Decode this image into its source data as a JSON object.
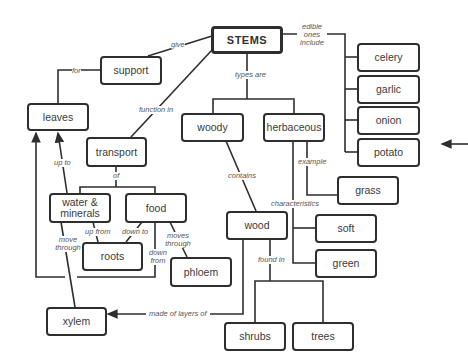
{
  "diagram": {
    "type": "concept-map",
    "root": "STEMS",
    "nodes": {
      "stems": "STEMS",
      "support": "support",
      "leaves": "leaves",
      "transport": "transport",
      "woody": "woody",
      "herbaceous": "herbaceous",
      "celery": "celery",
      "garlic": "garlic",
      "onion": "onion",
      "potato": "potato",
      "grass": "grass",
      "water_minerals": "water & minerals",
      "food": "food",
      "roots": "roots",
      "phloem": "phloem",
      "wood": "wood",
      "soft": "soft",
      "green": "green",
      "xylem": "xylem",
      "shrubs": "shrubs",
      "trees": "trees"
    },
    "links": {
      "give": "give",
      "for": "for",
      "function_in": "function in",
      "types_are": "types are",
      "edible_ones_include": "edible ones include",
      "of": "of",
      "up_to": "up to",
      "contains": "contains",
      "example": "example",
      "characteristics": "characteristics",
      "up_from": "up from",
      "down_to": "down to",
      "moves_through": "moves through",
      "down_from": "down from",
      "move_through": "move through",
      "found_in": "found in",
      "made_of_layers_of": "made of layers of"
    },
    "relations": [
      [
        "STEMS",
        "give",
        "support"
      ],
      [
        "support",
        "for",
        "leaves"
      ],
      [
        "STEMS",
        "function in",
        "transport"
      ],
      [
        "STEMS",
        "types are",
        "woody"
      ],
      [
        "STEMS",
        "types are",
        "herbaceous"
      ],
      [
        "STEMS",
        "edible ones include",
        "celery"
      ],
      [
        "STEMS",
        "edible ones include",
        "garlic"
      ],
      [
        "STEMS",
        "edible ones include",
        "onion"
      ],
      [
        "STEMS",
        "edible ones include",
        "potato"
      ],
      [
        "transport",
        "of",
        "water & minerals"
      ],
      [
        "transport",
        "of",
        "food"
      ],
      [
        "water & minerals",
        "up to",
        "leaves"
      ],
      [
        "water & minerals",
        "up from",
        "roots"
      ],
      [
        "water & minerals",
        "move through",
        "xylem"
      ],
      [
        "food",
        "down to",
        "roots"
      ],
      [
        "food",
        "moves through",
        "phloem"
      ],
      [
        "food",
        "down from",
        "leaves"
      ],
      [
        "woody",
        "contains",
        "wood"
      ],
      [
        "herbaceous",
        "example",
        "grass"
      ],
      [
        "herbaceous",
        "characteristics",
        "soft"
      ],
      [
        "herbaceous",
        "characteristics",
        "green"
      ],
      [
        "wood",
        "found in",
        "shrubs"
      ],
      [
        "wood",
        "found in",
        "trees"
      ],
      [
        "wood",
        "made of layers of",
        "xylem"
      ]
    ],
    "pointer_arrow": "left-pointing arrow at potato"
  }
}
